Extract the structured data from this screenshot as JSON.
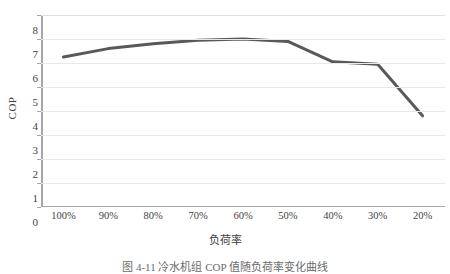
{
  "chart_data": {
    "type": "line",
    "title": "",
    "xlabel": "负荷率",
    "ylabel": "COP",
    "categories": [
      "100%",
      "90%",
      "80%",
      "70%",
      "60%",
      "50%",
      "40%",
      "30%",
      "20%"
    ],
    "values": [
      6.25,
      6.6,
      6.8,
      6.95,
      7.0,
      6.9,
      6.05,
      5.95,
      3.8
    ],
    "series": [
      {
        "name": "COP",
        "values": [
          6.25,
          6.6,
          6.8,
          6.95,
          7.0,
          6.9,
          6.05,
          5.95,
          3.8
        ],
        "color": "#595959"
      }
    ],
    "ylim": [
      0,
      8
    ],
    "yticks": [
      0,
      1,
      2,
      3,
      4,
      5,
      6,
      7,
      8
    ],
    "ytick_labels": [
      "0",
      "1",
      "2",
      "3",
      "4",
      "5",
      "6",
      "7",
      "8"
    ],
    "grid": true,
    "grid_axis": "y",
    "legend": false,
    "legend_position": "none",
    "markers": false,
    "line_width": 3,
    "colors": {
      "series_line": "#595959",
      "gridline": "#e8e8e8",
      "axis_line": "#a6a6a6",
      "text": "#3f3f3f",
      "background": "#ffffff"
    }
  },
  "caption": {
    "text": "图 4-11  冷水机组 COP 值随负荷率变化曲线"
  }
}
